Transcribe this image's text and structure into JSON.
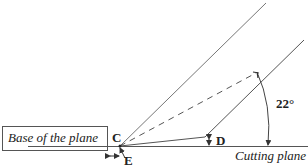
{
  "diagram": {
    "labels": {
      "base": "Base of the plane",
      "c": "C",
      "d": "D",
      "e": "E",
      "angle": "22°",
      "cutting": "Cutting plane"
    },
    "colors": {
      "line": "#555555",
      "text": "#222222"
    }
  }
}
